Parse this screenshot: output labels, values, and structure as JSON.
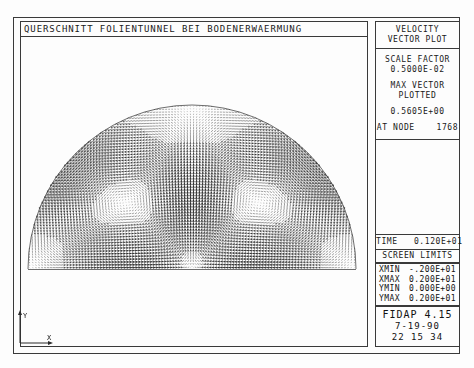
{
  "title": {
    "text": "QUERSCHNITT FOLIENTUNNEL BEI BODENERWAERMUNG"
  },
  "legend": {
    "header_line1": "VELOCITY",
    "header_line2": "VECTOR PLOT",
    "scale_factor_label": "SCALE FACTOR",
    "scale_factor_value": "0.5000E-02",
    "max_vector_label_line1": "MAX  VECTOR",
    "max_vector_label_line2": "PLOTTED",
    "max_vector_value": "0.5605E+00",
    "at_node_label": "AT NODE",
    "at_node_value": "1768"
  },
  "time_panel": {
    "label": "TIME",
    "value": "0.120E+01"
  },
  "screen_limits": {
    "title": "SCREEN LIMITS",
    "rows": [
      {
        "key": "XMIN",
        "value": "-.200E+01"
      },
      {
        "key": "XMAX",
        "value": "0.200E+01"
      },
      {
        "key": "YMIN",
        "value": "0.000E+00"
      },
      {
        "key": "YMAX",
        "value": "0.200E+01"
      }
    ]
  },
  "footer": {
    "program": "FIDAP 4.15",
    "date": "7-19-90",
    "time": "22 15 34"
  },
  "axis_triad": {
    "x_label": "X",
    "y_label": "Y"
  },
  "chart_data": {
    "type": "quiver",
    "title": "QUERSCHNITT FOLIENTUNNEL BEI BODENERWAERMUNG",
    "subtitle": "VELOCITY VECTOR PLOT",
    "domain": "half-disc (greenhouse tunnel cross-section) with soil heating",
    "xlabel": "X",
    "ylabel": "Y",
    "xlim": [
      -2.0,
      2.0
    ],
    "ylim": [
      0.0,
      2.0
    ],
    "grid": false,
    "legend_position": "right",
    "scale_factor": 0.005,
    "max_vector_magnitude": 0.5605,
    "max_vector_node": 1768,
    "time": 1.2,
    "geometry": {
      "shape": "semicircle",
      "radius": 2.0,
      "center": [
        0.0,
        0.0
      ],
      "base_y": 0.0
    },
    "flow_pattern": {
      "description": "two symmetric counter-rotating buoyancy cells rising along the vertical centerline and descending along the curved foil wall",
      "vortex_cores": [
        {
          "x": -0.85,
          "y": 0.82,
          "sense": "counterclockwise"
        },
        {
          "x": 0.85,
          "y": 0.82,
          "sense": "clockwise"
        }
      ],
      "plume": {
        "x": 0.0,
        "direction": "upward",
        "origin_y": 0.0
      }
    },
    "sampling": {
      "nx": 112,
      "ny": 58,
      "note": "dense uniform grid of arrow glyphs clipped to the half-disc"
    }
  }
}
